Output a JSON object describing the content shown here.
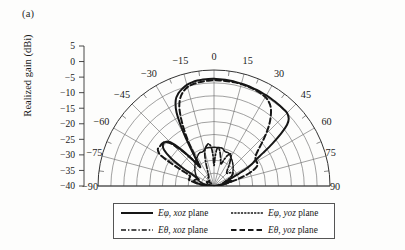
{
  "panel": {
    "label": "(a)"
  },
  "axis": {
    "ylabel": "Realized gain (dBi)",
    "radial_ticks": [
      "5",
      "0",
      "-5",
      "-10",
      "-15",
      "-20",
      "-25",
      "-30",
      "-35",
      "-40"
    ],
    "angular_ticks": [
      "-90",
      "-75",
      "-60",
      "-45",
      "-30",
      "-15",
      "0",
      "15",
      "30",
      "45",
      "60",
      "75",
      "90"
    ]
  },
  "legend": {
    "items": [
      {
        "id": "ephi-xoz",
        "symbol": "Eφ",
        "plane": "xoz",
        "suffix": "plane",
        "style": "solid-thick"
      },
      {
        "id": "ephi-yoz",
        "symbol": "Eφ",
        "plane": "yoz",
        "suffix": "plane",
        "style": "fine-dotted"
      },
      {
        "id": "etheta-xoz",
        "symbol": "Eθ",
        "plane": "xoz",
        "suffix": "plane",
        "style": "dash-dot"
      },
      {
        "id": "etheta-yoz",
        "symbol": "Eθ",
        "plane": "yoz",
        "suffix": "plane",
        "style": "dashed"
      }
    ]
  },
  "colors": {
    "grid": "#6e6e6e",
    "axis": "#333333",
    "curve": "#161616",
    "background": "#fdfdfc"
  },
  "chart_data": {
    "type": "line",
    "subtype": "polar-radiation-pattern",
    "title": "",
    "xlabel": "Theta (deg)",
    "ylabel": "Realized gain (dBi)",
    "rlim": [
      -40,
      5
    ],
    "rtick_step": 5,
    "theta_lim": [
      -90,
      90
    ],
    "theta_tick_step": 15,
    "theta_minor_step": 7.5,
    "grid": true,
    "legend_position": "below",
    "series": [
      {
        "name": "Eφ, xoz plane",
        "style": "solid-thick",
        "theta": [
          -90,
          -85,
          -80,
          -75,
          -70,
          -66,
          -62,
          -60,
          -57,
          -54,
          -51,
          -48,
          -45,
          -42,
          -39,
          -36,
          -33,
          -30,
          -27,
          -24,
          -21,
          -18,
          -15,
          -12,
          -9,
          -6,
          -3,
          0,
          3,
          6,
          9,
          12,
          15,
          18,
          21,
          24,
          27,
          30,
          33,
          36,
          39,
          42,
          45,
          48,
          50,
          52,
          54,
          56,
          58,
          60,
          62,
          64,
          66,
          68,
          70,
          72,
          74,
          76,
          78,
          80,
          82,
          84,
          86,
          88,
          90
        ],
        "values": [
          -40,
          -36,
          -33,
          -32,
          -32.5,
          -33.5,
          -30,
          -26,
          -20,
          -16,
          -14.5,
          -14.5,
          -16,
          -21,
          -27,
          -31,
          -26,
          -17,
          -8,
          -3.5,
          -1.5,
          -0.3,
          0.6,
          1.1,
          1.4,
          1.5,
          1.6,
          1.6,
          1.5,
          1.4,
          1.3,
          1.2,
          1.1,
          1.0,
          0.9,
          0.8,
          0.7,
          0.6,
          0.5,
          0.4,
          0.3,
          0.2,
          0.1,
          -1.0,
          -3.0,
          -7.0,
          -12.0,
          -17.0,
          -21.0,
          -23.0,
          -26.0,
          -30.0,
          -33.0,
          -34.5,
          -35.0,
          -34.0,
          -33.0,
          -33.5,
          -35.0,
          -36.5,
          -37.5,
          -38.5,
          -39.0,
          -39.5,
          -40
        ]
      },
      {
        "name": "Eφ, yoz plane",
        "style": "fine-dotted",
        "theta": [
          -90,
          -84,
          -78,
          -72,
          -66,
          -60,
          -54,
          -48,
          -42,
          -36,
          -30,
          -24,
          -18,
          -12,
          -6,
          0,
          6,
          12,
          18,
          24,
          30,
          36,
          42,
          48,
          54,
          60,
          66,
          72,
          78,
          84,
          90
        ],
        "values": [
          -40,
          -38,
          -36,
          -34,
          -33,
          -32,
          -31,
          -30,
          -29,
          -28,
          -27,
          -26,
          -26,
          -25,
          -25,
          -25,
          -25,
          -25,
          -26,
          -26,
          -27,
          -28,
          -29,
          -30,
          -31,
          -32,
          -33,
          -34,
          -36,
          -38,
          -40
        ]
      },
      {
        "name": "Eθ, xoz plane",
        "style": "dash-dot",
        "theta": [
          -90,
          -85,
          -80,
          -75,
          -70,
          -65,
          -60,
          -55,
          -50,
          -45,
          -40,
          -35,
          -30,
          -26,
          -22,
          -19,
          -16,
          -13,
          -10,
          -7,
          -4,
          -2,
          0,
          2,
          4,
          6,
          9,
          12,
          15,
          18,
          21,
          24,
          28,
          32,
          36,
          40,
          45,
          50,
          55,
          60,
          65,
          70,
          75,
          80,
          85,
          90
        ],
        "values": [
          -40,
          -40,
          -39,
          -38,
          -37.5,
          -37,
          -36.5,
          -37,
          -38,
          -38.5,
          -37,
          -36,
          -36,
          -35,
          -33,
          -30,
          -27,
          -25,
          -24,
          -23.5,
          -25,
          -28,
          -32,
          -29,
          -26,
          -25,
          -26,
          -28,
          -30,
          -31,
          -29,
          -27,
          -26,
          -28,
          -30,
          -32,
          -33,
          -32,
          -31,
          -32,
          -34,
          -36,
          -37,
          -38,
          -39,
          -40
        ]
      },
      {
        "name": "Eθ, yoz plane",
        "style": "dashed",
        "theta": [
          -90,
          -86,
          -82,
          -78,
          -76,
          -74,
          -72,
          -70,
          -68,
          -66,
          -64,
          -62,
          -60,
          -57,
          -54,
          -51,
          -48,
          -45,
          -42,
          -39,
          -36,
          -33,
          -30,
          -27,
          -24,
          -21,
          -18,
          -15,
          -12,
          -9,
          -6,
          -3,
          0,
          3,
          6,
          9,
          12,
          15,
          18,
          21,
          24,
          27,
          30,
          33,
          36,
          39,
          42,
          45,
          48,
          51,
          54,
          57,
          60,
          62,
          64,
          66,
          68,
          70,
          72,
          74,
          76,
          78,
          80,
          82,
          84,
          86,
          88,
          90
        ],
        "values": [
          -40,
          -38,
          -34,
          -31,
          -30,
          -30,
          -30,
          -30,
          -30,
          -29,
          -26,
          -21,
          -16,
          -14,
          -14,
          -14,
          -14.5,
          -17,
          -22,
          -27,
          -30,
          -27,
          -20,
          -13,
          -7,
          -3.5,
          -1.5,
          -0.3,
          0.3,
          0.6,
          0.8,
          0.9,
          1.0,
          1.0,
          1.0,
          1.0,
          1.0,
          0.9,
          0.8,
          0.7,
          0.5,
          0.2,
          -0.2,
          -1.0,
          -2.5,
          -5.0,
          -8.0,
          -11.5,
          -15.0,
          -18.0,
          -20.0,
          -20.8,
          -21.0,
          -21.0,
          -21.2,
          -22.0,
          -23.5,
          -25.5,
          -28.0,
          -30.5,
          -33.0,
          -35.0,
          -36.5,
          -38.0,
          -39.0,
          -39.6,
          -40,
          -40
        ]
      }
    ]
  }
}
